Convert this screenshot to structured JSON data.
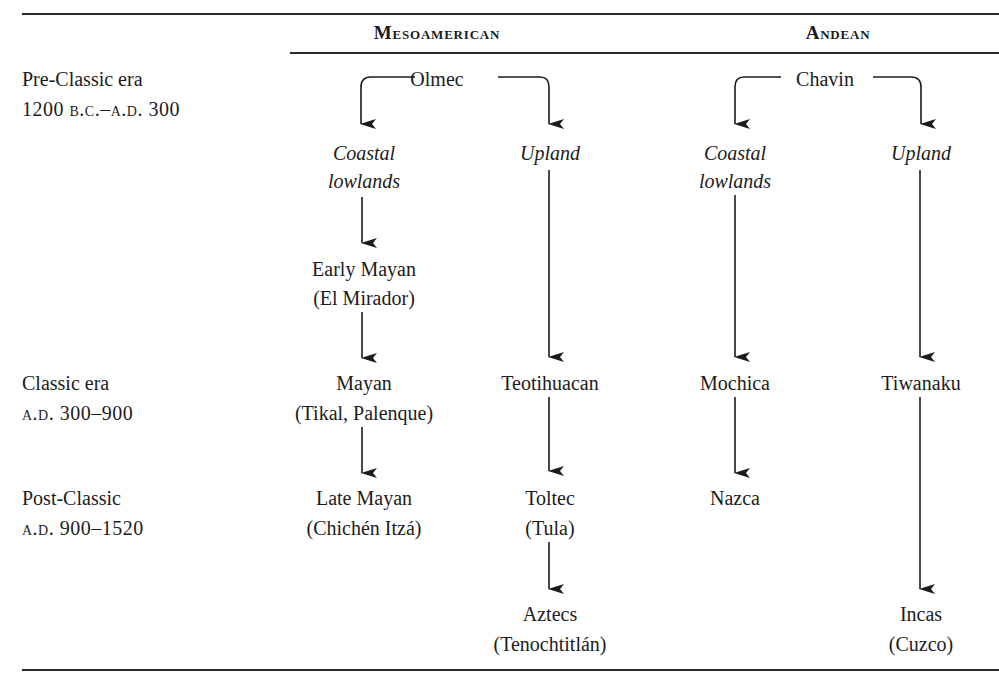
{
  "headers": {
    "mesoamerican": "Mesoamerican",
    "andean": "Andean"
  },
  "eras": [
    {
      "name": "Pre-Classic era",
      "dates": "1200 b.c.–a.d. 300"
    },
    {
      "name": "Classic era",
      "dates": "a.d. 300–900"
    },
    {
      "name": "Post-Classic",
      "dates": "a.d. 900–1520"
    }
  ],
  "mesoamerican": {
    "origin": "Olmec",
    "coastal": {
      "label_line1": "Coastal",
      "label_line2": "lowlands",
      "early": {
        "name": "Early Mayan",
        "site": "(El Mirador)"
      },
      "classic": {
        "name": "Mayan",
        "site": "(Tikal, Palenque)"
      },
      "post_classic": {
        "name": "Late Mayan",
        "site": "(Chichén Itzá)"
      }
    },
    "upland": {
      "label": "Upland",
      "classic": {
        "name": "Teotihuacan"
      },
      "post_classic": {
        "name": "Toltec",
        "site": "(Tula)"
      },
      "late": {
        "name": "Aztecs",
        "site": "(Tenochtitlán)"
      }
    }
  },
  "andean": {
    "origin": "Chavin",
    "coastal": {
      "label_line1": "Coastal",
      "label_line2": "lowlands",
      "classic": {
        "name": "Mochica"
      },
      "post_classic": {
        "name": "Nazca"
      }
    },
    "upland": {
      "label": "Upland",
      "classic": {
        "name": "Tiwanaku"
      },
      "late": {
        "name": "Incas",
        "site": "(Cuzco)"
      }
    }
  },
  "colors": {
    "ink": "#1c1c1c",
    "background": "#ffffff"
  }
}
